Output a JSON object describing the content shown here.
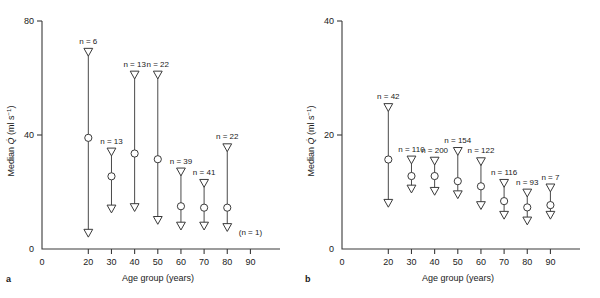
{
  "figure": {
    "panels": [
      {
        "letter": "a",
        "xlabel": "Age group (years)",
        "ylabel_parts": {
          "prefix": "Median ",
          "symbol": "Q",
          "dot": "̇",
          "units": " (ml s",
          "exponent": "−1",
          "units_close": ")"
        },
        "ylabel": "Median Q̇ (ml s−1)",
        "yticks": [
          "0",
          "40",
          "80"
        ],
        "xticks": [
          "0",
          "20",
          "30",
          "40",
          "50",
          "60",
          "70",
          "80",
          "90"
        ],
        "extra_note": "(n = 1)",
        "extra_note_x": 90,
        "groups": [
          {
            "age": 20,
            "n_label": "n = 6",
            "n": 6,
            "upper": 69.0,
            "median": 39.0,
            "lower": 5.5
          },
          {
            "age": 30,
            "n_label": "n = 13",
            "n": 13,
            "upper": 34.0,
            "median": 25.5,
            "lower": 14.0
          },
          {
            "age": 40,
            "n_label": "n = 13",
            "n": 13,
            "upper": 61.0,
            "median": 33.5,
            "lower": 14.5
          },
          {
            "age": 50,
            "n_label": "n = 22",
            "n": 22,
            "upper": 61.0,
            "median": 31.5,
            "lower": 10.0
          },
          {
            "age": 60,
            "n_label": "n = 39",
            "n": 39,
            "upper": 27.0,
            "median": 15.0,
            "lower": 8.0
          },
          {
            "age": 70,
            "n_label": "n = 41",
            "n": 41,
            "upper": 23.0,
            "median": 14.5,
            "lower": 8.0
          },
          {
            "age": 80,
            "n_label": "n = 22",
            "n": 22,
            "upper": 35.5,
            "median": 14.5,
            "lower": 7.5
          }
        ]
      },
      {
        "letter": "b",
        "xlabel": "Age group (years)",
        "ylabel_parts": {
          "prefix": "Median ",
          "symbol": "Q",
          "dot": "̇",
          "units": " (ml s",
          "exponent": "−1",
          "units_close": ")"
        },
        "ylabel": "Median Q̇ (ml s−1)",
        "yticks": [
          "0",
          "20",
          "40"
        ],
        "xticks": [
          "0",
          "20",
          "30",
          "40",
          "50",
          "60",
          "70",
          "80",
          "90"
        ],
        "extra_note": "",
        "groups": [
          {
            "age": 20,
            "n_label": "n = 42",
            "n": 42,
            "upper": 24.8,
            "median": 15.7,
            "lower": 8.0
          },
          {
            "age": 30,
            "n_label": "n = 110",
            "n": 110,
            "upper": 15.6,
            "median": 12.8,
            "lower": 10.5
          },
          {
            "age": 40,
            "n_label": "n = 200",
            "n": 200,
            "upper": 15.4,
            "median": 12.8,
            "lower": 10.1
          },
          {
            "age": 50,
            "n_label": "n = 154",
            "n": 154,
            "upper": 17.1,
            "median": 11.9,
            "lower": 9.5
          },
          {
            "age": 60,
            "n_label": "n = 122",
            "n": 122,
            "upper": 15.3,
            "median": 11.0,
            "lower": 7.6
          },
          {
            "age": 70,
            "n_label": "n = 116",
            "n": 116,
            "upper": 11.5,
            "median": 8.4,
            "lower": 5.9
          },
          {
            "age": 80,
            "n_label": "n = 93",
            "n": 93,
            "upper": 9.8,
            "median": 7.3,
            "lower": 4.9
          },
          {
            "age": 90,
            "n_label": "n = 7",
            "n": 7,
            "upper": 10.7,
            "median": 7.7,
            "lower": 5.9
          }
        ]
      }
    ]
  },
  "chart_data": {
    "type": "scatter",
    "title": "",
    "subtitle": "",
    "xlabel": "Age group (years)",
    "ylabel": "Median Q̇ (ml s−1)",
    "grid": false,
    "legend": "none",
    "marker_semantics": {
      "open_circle": "median",
      "down_triangle_top": "upper percentile limit",
      "down_triangle_bottom": "lower percentile limit",
      "vertical_line": "range between percentile limits"
    },
    "panels": [
      {
        "panel": "a",
        "xlim": [
          0,
          95
        ],
        "ylim": [
          0,
          80
        ],
        "yticks": [
          0,
          40,
          80
        ],
        "xticks": [
          0,
          20,
          30,
          40,
          50,
          60,
          70,
          80,
          90
        ],
        "x": [
          20,
          30,
          40,
          50,
          60,
          70,
          80
        ],
        "annotations": [
          "n = 6",
          "n = 13",
          "n = 13",
          "n = 22",
          "n = 39",
          "n = 41",
          "n = 22",
          "(n = 1)"
        ],
        "series": [
          {
            "name": "upper limit",
            "values": [
              69.0,
              34.0,
              61.0,
              61.0,
              27.0,
              23.0,
              35.5
            ]
          },
          {
            "name": "median",
            "values": [
              39.0,
              25.5,
              33.5,
              31.5,
              15.0,
              14.5,
              14.5
            ]
          },
          {
            "name": "lower limit",
            "values": [
              5.5,
              14.0,
              14.5,
              10.0,
              8.0,
              8.0,
              7.5
            ]
          },
          {
            "name": "n",
            "values": [
              6,
              13,
              13,
              22,
              39,
              41,
              22
            ]
          }
        ]
      },
      {
        "panel": "b",
        "xlim": [
          0,
          95
        ],
        "ylim": [
          0,
          40
        ],
        "yticks": [
          0,
          20,
          40
        ],
        "xticks": [
          0,
          20,
          30,
          40,
          50,
          60,
          70,
          80,
          90
        ],
        "x": [
          20,
          30,
          40,
          50,
          60,
          70,
          80,
          90
        ],
        "annotations": [
          "n = 42",
          "n = 110",
          "n = 200",
          "n = 154",
          "n = 122",
          "n = 116",
          "n = 93",
          "n = 7"
        ],
        "series": [
          {
            "name": "upper limit",
            "values": [
              24.8,
              15.6,
              15.4,
              17.1,
              15.3,
              11.5,
              9.8,
              10.7
            ]
          },
          {
            "name": "median",
            "values": [
              15.7,
              12.8,
              12.8,
              11.9,
              11.0,
              8.4,
              7.3,
              7.7
            ]
          },
          {
            "name": "lower limit",
            "values": [
              8.0,
              10.5,
              10.1,
              9.5,
              7.6,
              5.9,
              4.9,
              5.9
            ]
          },
          {
            "name": "n",
            "values": [
              42,
              110,
              200,
              154,
              122,
              116,
              93,
              7
            ]
          }
        ]
      }
    ]
  }
}
